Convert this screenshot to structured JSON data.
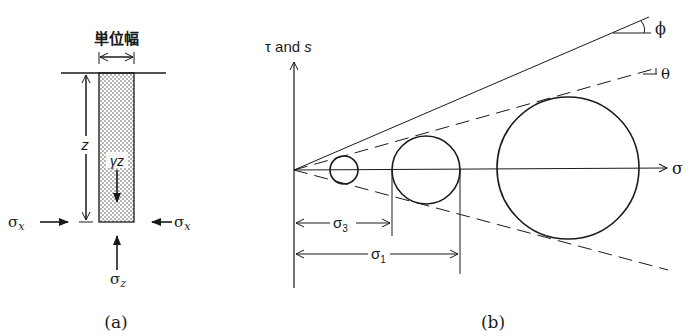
{
  "panel_a": {
    "title": "単位幅",
    "depth_label": "z",
    "weight_label": "γz",
    "sigma_x_left": "σx",
    "sigma_x_right": "σx",
    "sigma_z": "σz",
    "caption": "(a)"
  },
  "panel_b": {
    "y_axis_label": "τ and s",
    "x_axis_label": "σ",
    "phi_label": "ϕ",
    "theta_label": "θ",
    "sigma3_label": "σ3",
    "sigma1_label": "σ1",
    "caption": "(b)",
    "circles": [
      {
        "name": "small",
        "cx": 344,
        "cy": 170,
        "r": 14
      },
      {
        "name": "medium",
        "cx": 426,
        "cy": 170,
        "r": 34
      },
      {
        "name": "large",
        "cx": 568,
        "cy": 168,
        "r": 71
      }
    ]
  },
  "colors": {
    "line": "#1a1a1a",
    "background": "#ffffff"
  }
}
